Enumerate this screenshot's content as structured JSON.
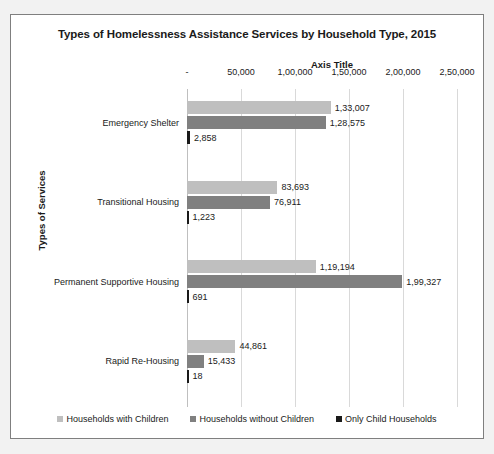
{
  "chart_data": {
    "type": "bar",
    "orientation": "horizontal",
    "title": "Types of Homelessness Assistance Services by Household Type, 2015",
    "xlabel": "Axis Title",
    "ylabel": "Types of Services",
    "grid": true,
    "legend_position": "bottom",
    "xlim": [
      0,
      250000
    ],
    "xticks": [
      0,
      50000,
      100000,
      150000,
      200000,
      250000
    ],
    "xtick_labels": [
      "-",
      "50,000",
      "1,00,000",
      "1,50,000",
      "2,00,000",
      "2,50,000"
    ],
    "categories": [
      "Emergency Shelter",
      "Transitional Housing",
      "Permanent Supportive Housing",
      "Rapid Re-Housing"
    ],
    "series": [
      {
        "name": "Households with Children",
        "color": "#bfbfbf",
        "values": [
          133007,
          83693,
          119194,
          44861
        ],
        "labels": [
          "1,33,007",
          "83,693",
          "1,19,194",
          "44,861"
        ]
      },
      {
        "name": "Households without Children",
        "color": "#808080",
        "values": [
          128575,
          76911,
          199327,
          15433
        ],
        "labels": [
          "1,28,575",
          "76,911",
          "1,99,327",
          "15,433"
        ]
      },
      {
        "name": "Only Child Households",
        "color": "#1a1a1a",
        "values": [
          2858,
          1223,
          691,
          18
        ],
        "labels": [
          "2,858",
          "1,223",
          "691",
          "18"
        ]
      }
    ]
  },
  "colors": {
    "frame_border": "#7f7f7f",
    "plot_background": "#ffffff",
    "page_background": "#f2f2f2",
    "gridline": "#d9d9d9",
    "text": "#1a1a1a"
  }
}
